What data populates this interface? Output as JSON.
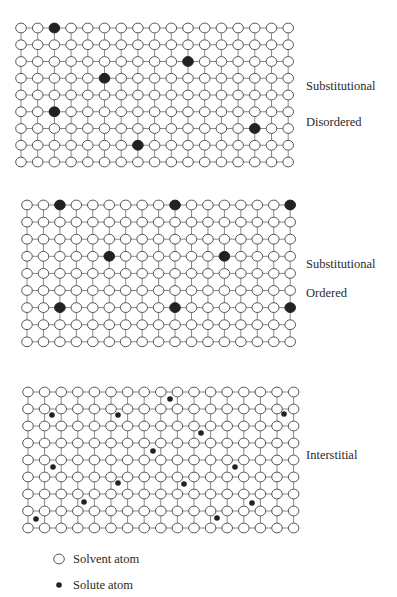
{
  "colors": {
    "line": "#7a7a7a",
    "circle_stroke": "#555555",
    "circle_fill": "#ffffff",
    "solute": "#222222",
    "text": "#2a2a2a"
  },
  "panels": [
    {
      "id": "substitutional-disordered",
      "labels": [
        "Substitutional",
        "Disordered"
      ],
      "label_positions": [
        {
          "x": 306,
          "y": 80
        },
        {
          "x": 306,
          "y": 116
        }
      ],
      "grid": {
        "cols": 17,
        "rows": 9,
        "x0": 21,
        "y0": 28,
        "dx": 16.7,
        "dy": 16.75
      },
      "solute_type": "substitutional",
      "solute_sites": [
        [
          0,
          2
        ],
        [
          2,
          10
        ],
        [
          3,
          5
        ],
        [
          5,
          2
        ],
        [
          6,
          14
        ],
        [
          7,
          7
        ]
      ]
    },
    {
      "id": "substitutional-ordered",
      "labels": [
        "Substitutional",
        "Ordered"
      ],
      "label_positions": [
        {
          "x": 306,
          "y": 258
        },
        {
          "x": 306,
          "y": 287
        }
      ],
      "grid": {
        "cols": 17,
        "rows": 9,
        "x0": 27,
        "y0": 205,
        "dx": 16.45,
        "dy": 17.1
      },
      "solute_type": "substitutional",
      "solute_sites": [
        [
          0,
          2
        ],
        [
          0,
          9
        ],
        [
          0,
          16
        ],
        [
          3,
          5
        ],
        [
          3,
          12
        ],
        [
          6,
          2
        ],
        [
          6,
          9
        ],
        [
          6,
          16
        ]
      ]
    },
    {
      "id": "interstitial",
      "labels": [
        "Interstitial"
      ],
      "label_positions": [
        {
          "x": 306,
          "y": 449
        }
      ],
      "grid": {
        "cols": 17,
        "rows": 9,
        "x0": 28,
        "y0": 392,
        "dx": 16.6,
        "dy": 17.0
      },
      "solute_type": "interstitial",
      "interstitial_points": [
        [
          170,
          399
        ],
        [
          52,
          415
        ],
        [
          118,
          415
        ],
        [
          284,
          414
        ],
        [
          201,
          433
        ],
        [
          153,
          451
        ],
        [
          53,
          467
        ],
        [
          235,
          467
        ],
        [
          118,
          483
        ],
        [
          184,
          484
        ],
        [
          84,
          502
        ],
        [
          252,
          503
        ],
        [
          36,
          519
        ],
        [
          217,
          518
        ]
      ]
    }
  ],
  "legend": {
    "items": [
      {
        "symbol": "open-circle",
        "label": "Solvent atom",
        "x": 59,
        "y": 559
      },
      {
        "symbol": "filled-dot",
        "label": "Solute atom",
        "x": 59,
        "y": 585
      }
    ]
  }
}
